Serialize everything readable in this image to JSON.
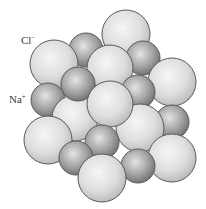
{
  "diagram": {
    "labels": {
      "chloride": {
        "symbol": "Cl",
        "charge": "−"
      },
      "sodium": {
        "symbol": "Na",
        "charge": "+"
      }
    },
    "ion_colors": {
      "chloride_light": "#f6f6f6",
      "chloride_mid": "#dedede",
      "chloride_dark": "#b9b9b9",
      "sodium_light": "#e4e4e4",
      "sodium_mid": "#a7a7a7",
      "sodium_dark": "#6f6f6f",
      "outline": "#5a5a5a"
    },
    "ion_counts": {
      "chloride": 10,
      "sodium": 10
    }
  }
}
